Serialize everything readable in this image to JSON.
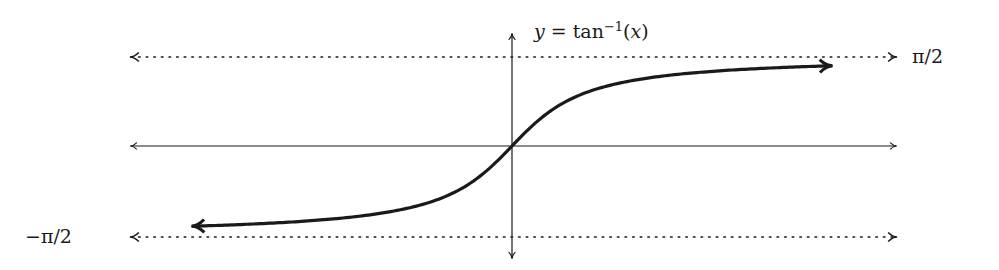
{
  "chart_data": {
    "type": "line",
    "function": "arctan",
    "xlabel": "",
    "ylabel": "",
    "xlim": [
      -7,
      7
    ],
    "ylim": [
      -2,
      2
    ],
    "grid": false,
    "legend": "none",
    "axes": {
      "x_arrows": "both",
      "y_arrows": "both",
      "ticks": false
    },
    "asymptotes": [
      {
        "y": 1.5708,
        "label": "π/2",
        "style": "dotted",
        "arrows": "both"
      },
      {
        "y": -1.5708,
        "label": "−π/2",
        "style": "dotted",
        "arrows": "both"
      }
    ],
    "series": [
      {
        "name": "y = tan^-1(x)",
        "x_range": [
          -5.8,
          5.8
        ],
        "arrows": "both",
        "x": [
          -5.8,
          -4,
          -3,
          -2,
          -1,
          -0.5,
          0,
          0.5,
          1,
          2,
          3,
          4,
          5.8
        ],
        "y": [
          -1.4,
          -1.326,
          -1.249,
          -1.107,
          -0.785,
          -0.464,
          0,
          0.464,
          0.785,
          1.107,
          1.249,
          1.326,
          1.4
        ]
      }
    ],
    "annotations": [
      {
        "text": "y = tan^-1(x)",
        "position": "top, right of y-axis"
      },
      {
        "text": "π/2",
        "position": "right end of upper asymptote"
      },
      {
        "text": "−π/2",
        "position": "left end of lower asymptote"
      }
    ]
  },
  "labels": {
    "func_y": "y",
    "func_eq": " = tan",
    "func_exp": "−1",
    "func_arg_open": "(",
    "func_arg": "x",
    "func_arg_close": ")",
    "top_asymptote": "π/2",
    "bottom_asymptote": "−π/2"
  },
  "layout": {
    "origin_px": [
      512,
      146
    ],
    "x_scale_px": 55,
    "y_scale_px": 57.3,
    "axis_x_px": [
      130,
      897
    ],
    "axis_y_px": [
      33,
      258
    ]
  },
  "colors": {
    "ink": "#1a1a1a",
    "background": "#ffffff"
  }
}
